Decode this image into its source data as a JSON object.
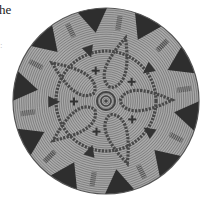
{
  "caption": {
    "line1": "he",
    "line2": ":"
  },
  "basket": {
    "description": "Top view of a coiled woven basket with rim triangles, hatched bar motifs, five-lobed braided star and central spiral",
    "center": [
      106,
      101
    ],
    "radius": 93,
    "colors": {
      "base": "#a9a9a9",
      "coil_line": "#7f7f7f",
      "dark": "#2e2e2e",
      "braid": "#4a4a4a"
    },
    "rim_triangle_count": 10,
    "bar_motif_count": 10,
    "inner_lobes": 5,
    "cross_motif_count": 5
  }
}
